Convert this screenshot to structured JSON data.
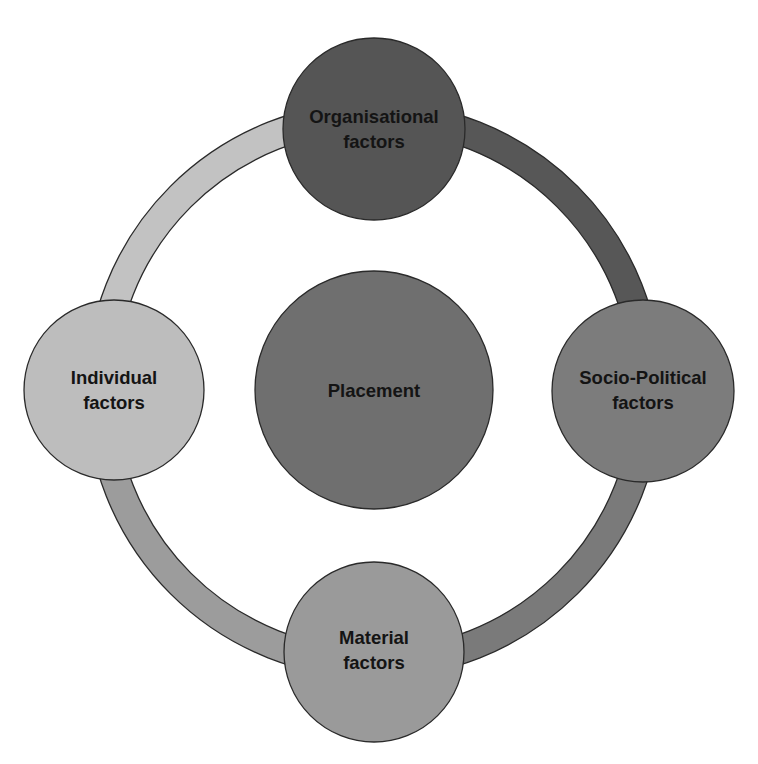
{
  "diagram": {
    "type": "cycle-with-hub",
    "center": {
      "label": "Placement",
      "fill": "#6f6f6f"
    },
    "nodes": [
      {
        "id": "organisational",
        "position": "top",
        "line1": "Organisational",
        "line2": "factors",
        "fill": "#555555"
      },
      {
        "id": "socio-political",
        "position": "right",
        "line1": "Socio-Political",
        "line2": "factors",
        "fill": "#7c7c7c"
      },
      {
        "id": "material",
        "position": "bottom",
        "line1": "Material",
        "line2": "factors",
        "fill": "#9a9a9a"
      },
      {
        "id": "individual",
        "position": "left",
        "line1": "Individual",
        "line2": "factors",
        "fill": "#bdbdbd"
      }
    ],
    "ring_segments": [
      {
        "from": "individual",
        "to": "organisational",
        "fill": "#c2c2c2"
      },
      {
        "from": "organisational",
        "to": "socio-political",
        "fill": "#575757"
      },
      {
        "from": "socio-political",
        "to": "material",
        "fill": "#7a7a7a"
      },
      {
        "from": "material",
        "to": "individual",
        "fill": "#9c9c9c"
      }
    ],
    "outline_color": "#2a2a2a"
  }
}
